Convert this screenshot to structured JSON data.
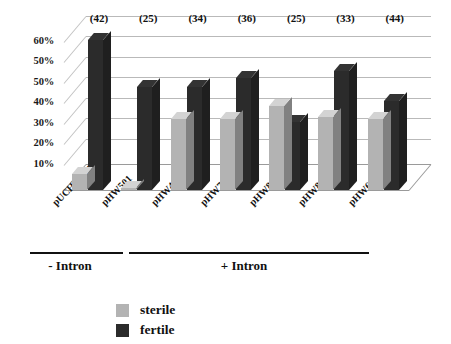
{
  "chart_data": {
    "type": "bar",
    "title": "",
    "xlabel": "",
    "ylabel": "",
    "ylim": [
      0,
      70
    ],
    "grid": true,
    "legend_position": "bottom-left",
    "style": "3d-clustered-column",
    "categories": [
      "pUCH27371",
      "pHW501",
      "pHW491",
      "pHW781",
      "pHW841",
      "pHW851",
      "pHW681"
    ],
    "series": [
      {
        "name": "sterile",
        "color": "#b3b3b3",
        "values": [
          7,
          1,
          31,
          31,
          37,
          32,
          31
        ]
      },
      {
        "name": "fertile",
        "color": "#2b2b2b",
        "values": [
          66,
          45,
          45,
          49,
          30,
          52,
          39
        ]
      }
    ],
    "point_labels": {
      "name": "n",
      "values": [
        "(42)",
        "(25)",
        "(34)",
        "(36)",
        "(25)",
        "(33)",
        "(44)"
      ]
    },
    "yticks": [
      "60%",
      "50%",
      "50%",
      "40%",
      "30%",
      "20%",
      "10%"
    ],
    "ytick_values": [
      65,
      56,
      47,
      38,
      29,
      20,
      11
    ],
    "annotations": [
      {
        "label": "- Intron",
        "from": 0,
        "to": 1
      },
      {
        "label": "+ Intron",
        "from": 2,
        "to": 6
      }
    ]
  },
  "legend": {
    "items": [
      {
        "label": "sterile",
        "color": "#b3b3b3"
      },
      {
        "label": "fertile",
        "color": "#2b2b2b"
      }
    ]
  }
}
